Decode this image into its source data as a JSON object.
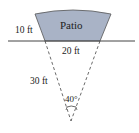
{
  "diagram": {
    "type": "sector-patio",
    "colors": {
      "patio_fill": "#a9b3c6",
      "stroke": "#333333",
      "background": "#ffffff"
    },
    "labels": {
      "patio": "Patio",
      "inner_radius": "10 ft",
      "chord": "20 ft",
      "outer_radius": "30 ft",
      "angle": "40°"
    }
  }
}
